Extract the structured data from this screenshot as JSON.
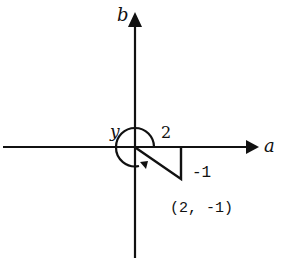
{
  "diagram": {
    "type": "complex-plane-polar-angle",
    "axes": {
      "horizontal_label": "a",
      "vertical_label": "b"
    },
    "point": {
      "label": "(2, -1)",
      "a": 2,
      "b": -1
    },
    "triangle": {
      "horizontal_leg_label": "2",
      "vertical_leg_label": "-1"
    },
    "angle": {
      "label": "y",
      "direction": "counterclockwise"
    },
    "colors": {
      "stroke": "#111111",
      "background": "#ffffff"
    }
  }
}
